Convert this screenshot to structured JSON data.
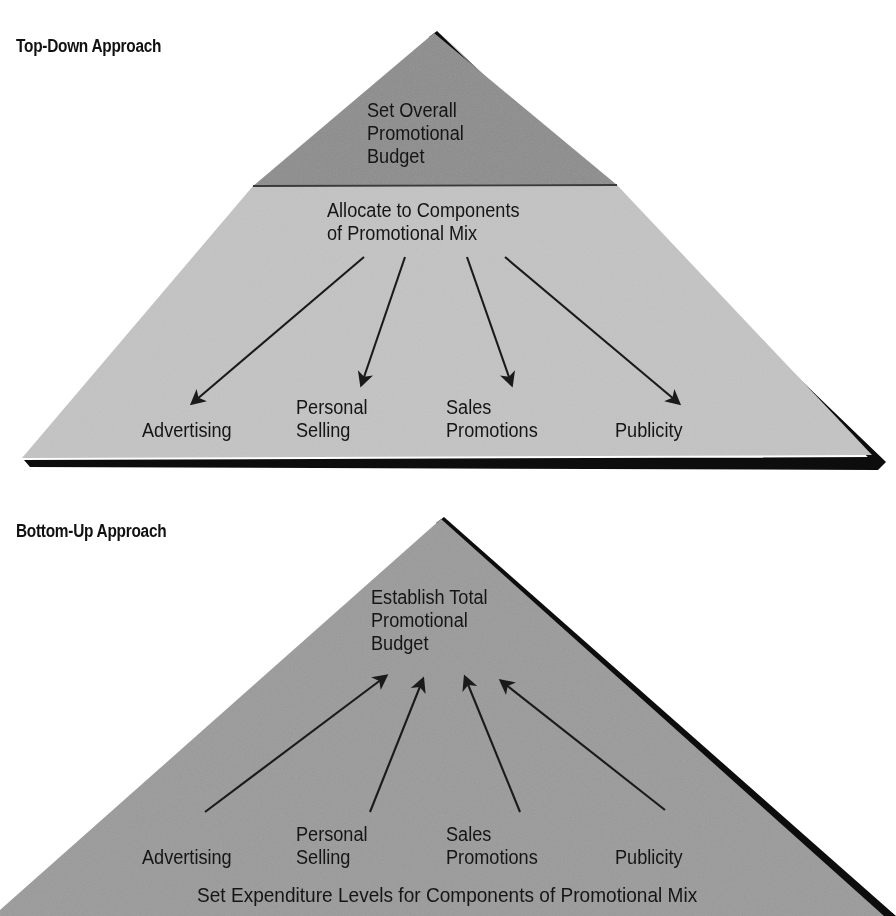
{
  "figure": {
    "kind": "two-pyramid process diagram",
    "background_color": "#ffffff"
  },
  "diagrams": [
    {
      "id": "top-down",
      "heading": "Top-Down Approach",
      "apex_label": "Set Overall\nPromotional\nBudget",
      "apex_label_lines": [
        "Set Overall",
        "Promotional",
        "Budget"
      ],
      "body_label": "Allocate to Components\nof Promotional Mix",
      "body_label_lines": [
        "Allocate to Components",
        "of Promotional Mix"
      ],
      "arrow_direction": "down",
      "components": [
        {
          "label": "Advertising",
          "lines": [
            "Advertising"
          ]
        },
        {
          "label": "Personal Selling",
          "lines": [
            "Personal",
            "Selling"
          ]
        },
        {
          "label": "Sales Promotions",
          "lines": [
            "Sales",
            "Promotions"
          ]
        },
        {
          "label": "Publicity",
          "lines": [
            "Publicity"
          ]
        }
      ],
      "colors": {
        "top_band": "#8c8c8c",
        "body": "#c3c3c3",
        "shadow": "#111111",
        "text": "#151515"
      }
    },
    {
      "id": "bottom-up",
      "heading": "Bottom-Up Approach",
      "apex_label": "Establish Total\nPromotional\nBudget",
      "apex_label_lines": [
        "Establish Total",
        "Promotional",
        "Budget"
      ],
      "base_label": "Set Expenditure Levels for Components of Promotional Mix",
      "arrow_direction": "up",
      "components": [
        {
          "label": "Advertising",
          "lines": [
            "Advertising"
          ]
        },
        {
          "label": "Personal Selling",
          "lines": [
            "Personal",
            "Selling"
          ]
        },
        {
          "label": "Sales Promotions",
          "lines": [
            "Sales",
            "Promotions"
          ]
        },
        {
          "label": "Publicity",
          "lines": [
            "Publicity"
          ]
        }
      ],
      "colors": {
        "body": "#9a9a9a",
        "shadow": "#111111",
        "text": "#151515"
      }
    }
  ],
  "top": {
    "heading": "Top-Down Approach",
    "budget": "Set Overall\nPromotional\nBudget",
    "allocate": "Allocate to Components\nof Promotional Mix",
    "advertising": "Advertising",
    "personal_selling": "Personal\nSelling",
    "sales_promotions": "Sales\nPromotions",
    "publicity": "Publicity"
  },
  "bottom": {
    "heading": "Bottom-Up Approach",
    "budget": "Establish Total\nPromotional\nBudget",
    "advertising": "Advertising",
    "personal_selling": "Personal\nSelling",
    "sales_promotions": "Sales\nPromotions",
    "publicity": "Publicity",
    "base": "Set Expenditure Levels for Components of Promotional Mix"
  }
}
